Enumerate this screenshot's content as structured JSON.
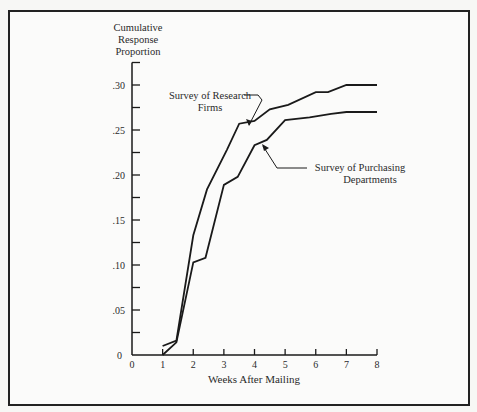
{
  "chart_data": {
    "type": "line",
    "title": "",
    "ylabel": "Cumulative Response Proportion",
    "ylabel_lines": [
      "Cumulative",
      "Response",
      "Proportion"
    ],
    "xlabel": "Weeks After Mailing",
    "xlim": [
      0,
      8
    ],
    "ylim": [
      0,
      0.325
    ],
    "x_ticks": [
      "0",
      "1",
      "2",
      "3",
      "4",
      "5",
      "6",
      "7",
      "8"
    ],
    "y_ticks": [
      "0",
      ".05",
      ".10",
      ".15",
      ".20",
      ".25",
      ".30"
    ],
    "y_tick_values": [
      0,
      0.05,
      0.1,
      0.15,
      0.2,
      0.25,
      0.3
    ],
    "y_minor_ticks": [
      0.025,
      0.075,
      0.125,
      0.175,
      0.225,
      0.275,
      0.325
    ],
    "grid": false,
    "legend_position": "inline annotations with arrows",
    "series": [
      {
        "name": "Survey of Research Firms",
        "label_lines": [
          "Survey of Research",
          "Firms"
        ],
        "x": [
          1,
          1.45,
          2,
          2.45,
          3.1,
          3.5,
          4,
          4.5,
          5.1,
          6,
          6.4,
          7,
          8
        ],
        "values": [
          0.01,
          0.016,
          0.133,
          0.184,
          0.228,
          0.257,
          0.26,
          0.273,
          0.278,
          0.292,
          0.292,
          0.3,
          0.3
        ]
      },
      {
        "name": "Survey of Purchasing Departments",
        "label_lines": [
          "Survey of Purchasing",
          "Departments"
        ],
        "x": [
          1,
          1.45,
          2,
          2.4,
          3,
          3.45,
          4,
          4.4,
          5,
          5.8,
          6.5,
          7,
          8
        ],
        "values": [
          0.0,
          0.014,
          0.103,
          0.108,
          0.189,
          0.198,
          0.233,
          0.239,
          0.261,
          0.264,
          0.268,
          0.27,
          0.27
        ]
      }
    ]
  },
  "colors": {
    "line": "#1a1a1a",
    "frame": "#222222",
    "background": "#fbfbfa"
  }
}
